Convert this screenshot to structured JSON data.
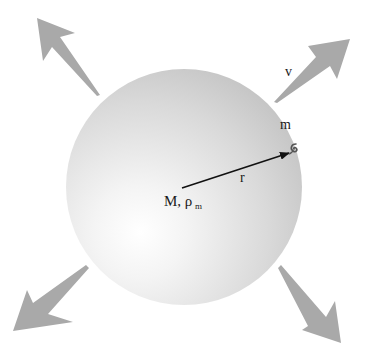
{
  "diagram": {
    "colors": {
      "background": "#ffffff",
      "sphere_highlight": "#ffffff",
      "sphere_edge": "#c6c6c6",
      "expansion_arrow": "#a9a9a9",
      "radius_arrow": "#111111",
      "text": "#1a1a1a"
    },
    "sphere": {
      "cx": 184,
      "cy": 187,
      "r": 118
    },
    "labels": {
      "mass_symbol": "M, ρ",
      "mass_subscript": "m",
      "radius": "r",
      "test_mass": "m",
      "velocity": "v"
    },
    "expansion_arrows": [
      {
        "id": "top-left",
        "direction": "up-left"
      },
      {
        "id": "top-right",
        "direction": "up-right"
      },
      {
        "id": "bottom-left",
        "direction": "down-left"
      },
      {
        "id": "bottom-right",
        "direction": "down-right"
      }
    ],
    "radius_arrow": {
      "from": [
        182,
        188
      ],
      "to": [
        289,
        153
      ]
    },
    "test_particle": {
      "x": 292,
      "y": 148,
      "glyph": "galaxy-swirl"
    }
  }
}
